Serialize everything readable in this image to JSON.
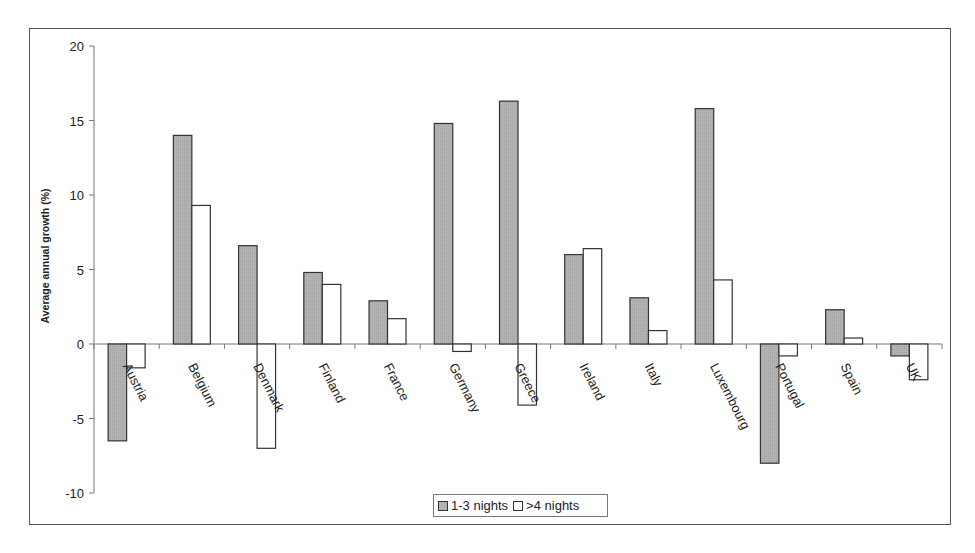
{
  "chart_data": {
    "type": "bar",
    "title": "",
    "xlabel": "",
    "ylabel": "Average annual growth (%)",
    "ylim": [
      -10,
      20
    ],
    "yticks": [
      20,
      15,
      10,
      5,
      0,
      -5,
      -10
    ],
    "grid": false,
    "legend_position": "bottom",
    "categories": [
      "Austria",
      "Belgium",
      "Denmark",
      "Finland",
      "France",
      "Germany",
      "Greece",
      "Ireland",
      "Italy",
      "Luxembourg",
      "Portugal",
      "Spain",
      "UK"
    ],
    "series": [
      {
        "name": "1-3 nights",
        "color": "#b3b3b3",
        "values": [
          -6.5,
          14.0,
          6.6,
          4.8,
          2.9,
          14.8,
          16.3,
          6.0,
          3.1,
          15.8,
          -8.0,
          2.3,
          -0.8
        ]
      },
      {
        "name": ">4 nights",
        "color": "#ffffff",
        "values": [
          -1.6,
          9.3,
          -7.0,
          4.0,
          1.7,
          -0.5,
          -4.1,
          6.4,
          0.9,
          4.3,
          -0.8,
          0.4,
          -2.4
        ]
      }
    ]
  },
  "legend": {
    "items": [
      {
        "label": "1-3 nights",
        "color": "#b3b3b3"
      },
      {
        "label": ">4 nights",
        "color": "#ffffff"
      }
    ]
  }
}
